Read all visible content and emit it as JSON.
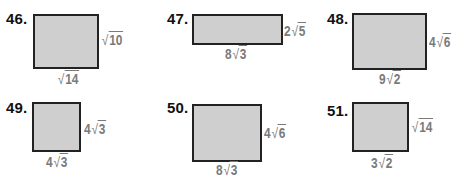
{
  "problems": [
    {
      "number": "46.",
      "side": {
        "coef": "",
        "radical": "√",
        "radicand": "10"
      },
      "bottom": {
        "coef": "",
        "radical": "√",
        "radicand": "14"
      }
    },
    {
      "number": "47.",
      "side": {
        "coef": "2",
        "radical": "√",
        "radicand": "5"
      },
      "bottom": {
        "coef": "8",
        "radical": "√",
        "radicand": "3"
      }
    },
    {
      "number": "48.",
      "side": {
        "coef": "4",
        "radical": "√",
        "radicand": "6"
      },
      "bottom": {
        "coef": "9",
        "radical": "√",
        "radicand": "2"
      }
    },
    {
      "number": "49.",
      "side": {
        "coef": "4",
        "radical": "√",
        "radicand": "3"
      },
      "bottom": {
        "coef": "4",
        "radical": "√",
        "radicand": "3"
      }
    },
    {
      "number": "50.",
      "side": {
        "coef": "4",
        "radical": "√",
        "radicand": "6"
      },
      "bottom": {
        "coef": "8",
        "radical": "√",
        "radicand": "3"
      }
    },
    {
      "number": "51.",
      "side": {
        "coef": "",
        "radical": "√",
        "radicand": "14"
      },
      "bottom": {
        "coef": "3",
        "radical": "√",
        "radicand": "2"
      }
    }
  ],
  "colors": {
    "fill": "#cfcfcf",
    "border": "#222222",
    "label": "#7a7a7a",
    "number": "#111111"
  }
}
